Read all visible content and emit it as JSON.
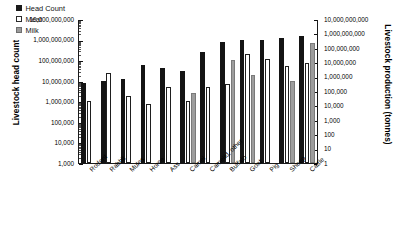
{
  "chart_data": {
    "type": "bar",
    "title": "",
    "xlabel": "",
    "ylabel": "Livestock head count",
    "y2label": "Livestock production (tonnes)",
    "scale": "log",
    "grid": false,
    "legend_position": "top-left",
    "ylim": [
      1000,
      10000000000
    ],
    "y2lim": [
      1,
      10000000000
    ],
    "categories": [
      "Rodent",
      "Rabbit",
      "Mules",
      "Horse",
      "Ass",
      "Camel",
      "Camelid, other",
      "Buffalo",
      "Goat",
      "Pig",
      "Sheep",
      "Cattle"
    ],
    "series": [
      {
        "name": "Head Count",
        "color": "#141414",
        "values": [
          8000000,
          10000000,
          12000000,
          60000000,
          43000000,
          30000000,
          250000000,
          800000000,
          1000000000,
          1000000000,
          1200000000,
          1500000000
        ]
      },
      {
        "name": "Meat",
        "color": "#ffffff",
        "values": [
          1000000,
          25000000,
          1800000,
          750000,
          5000000,
          1000000,
          5000000,
          7000000,
          200000000,
          115000000,
          50000000,
          70000000
        ]
      },
      {
        "name": "Milk",
        "color": "#9d9d9d",
        "values": [
          null,
          null,
          null,
          null,
          null,
          2500000,
          null,
          100000000,
          18000000,
          null,
          10000000,
          650000000
        ]
      }
    ],
    "y_ticks": [
      "10,000,000,000",
      "1,000,000,000",
      "100,000,000",
      "10,000,000",
      "1,000,000",
      "100,000",
      "10,000",
      "1,000"
    ],
    "y2_ticks": [
      "10,000,000,000",
      "1,000,000,000",
      "100,000,000",
      "10,000,000",
      "1,000,000",
      "100,000",
      "10,000",
      "1,000",
      "100",
      "10",
      "1"
    ]
  }
}
